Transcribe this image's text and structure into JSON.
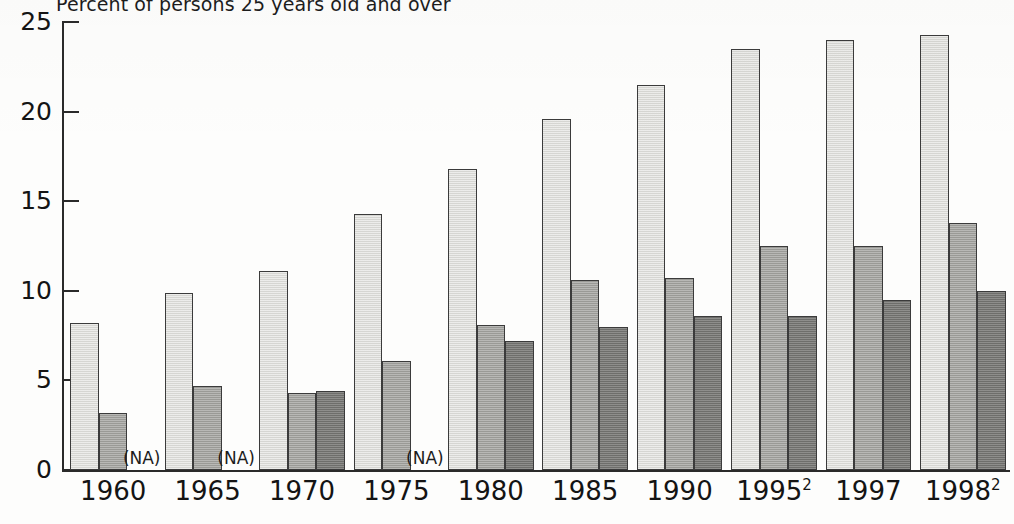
{
  "chart_data": {
    "type": "bar",
    "title": "Percent of persons 25 years old and over",
    "xlabel": "",
    "ylabel": "",
    "ylim": [
      0,
      25
    ],
    "yticks": [
      0,
      5,
      10,
      15,
      20,
      25
    ],
    "grid": false,
    "legend_position": "none",
    "categories": [
      "1960",
      "1965",
      "1970",
      "1975",
      "1980",
      "1985",
      "1990",
      "1995",
      "1997",
      "1998"
    ],
    "category_labels": [
      {
        "text": "1960",
        "sup": ""
      },
      {
        "text": "1965",
        "sup": ""
      },
      {
        "text": "1970",
        "sup": ""
      },
      {
        "text": "1975",
        "sup": ""
      },
      {
        "text": "1980",
        "sup": ""
      },
      {
        "text": "1985",
        "sup": ""
      },
      {
        "text": "1990",
        "sup": ""
      },
      {
        "text": "1995",
        "sup": "2"
      },
      {
        "text": "1997",
        "sup": ""
      },
      {
        "text": "1998",
        "sup": "2"
      }
    ],
    "series": [
      {
        "name": "series-1",
        "shade": "light",
        "color": "#d6d6d2",
        "values": [
          8.2,
          9.9,
          11.1,
          14.3,
          16.8,
          19.6,
          21.5,
          23.5,
          24.0,
          24.3
        ]
      },
      {
        "name": "series-2",
        "shade": "medium",
        "color": "#9a9a96",
        "values": [
          3.2,
          4.7,
          4.3,
          6.1,
          8.1,
          10.6,
          10.7,
          12.5,
          12.5,
          13.8
        ]
      },
      {
        "name": "series-3",
        "shade": "dark",
        "color": "#6e6e6b",
        "values": [
          null,
          null,
          4.4,
          null,
          7.2,
          8.0,
          8.6,
          8.6,
          9.5,
          10.0
        ]
      }
    ],
    "missing_marker": "(NA)",
    "missing_cells": [
      {
        "category": "1960",
        "series": "series-3"
      },
      {
        "category": "1965",
        "series": "series-3"
      },
      {
        "category": "1975",
        "series": "series-3"
      }
    ]
  },
  "axis": {
    "y_tick_labels": [
      "25",
      "20",
      "15",
      "10",
      "5",
      "0"
    ]
  }
}
